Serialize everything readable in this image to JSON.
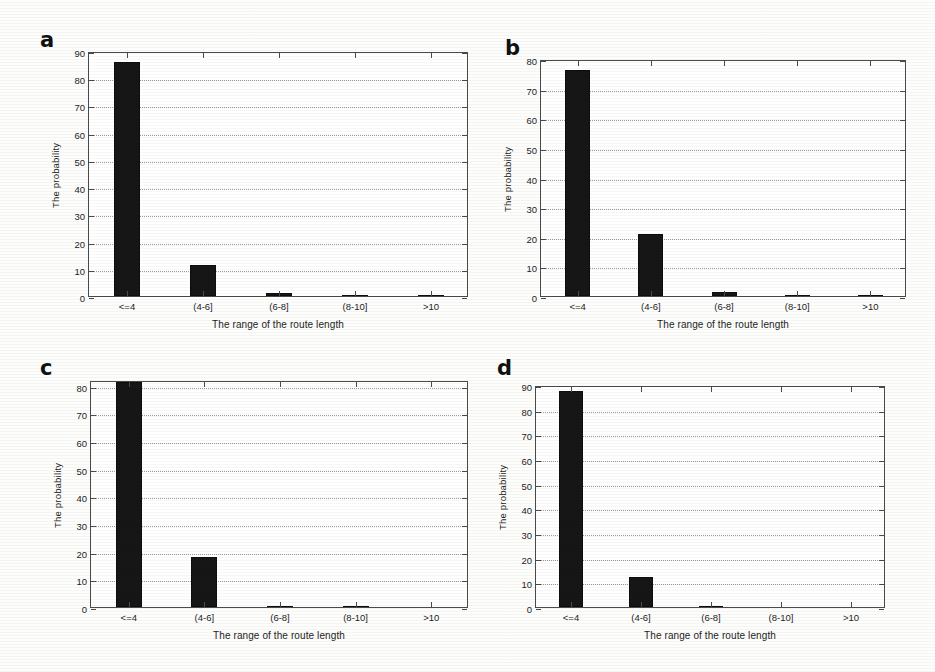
{
  "figure": {
    "background_color": "#fdfdfc",
    "bar_color": "#161616",
    "axis_color": "#4a4a4a",
    "grid_color": "#9a9a9a",
    "panel_letters": [
      "a",
      "b",
      "c",
      "d"
    ],
    "shared_xlabel": "The range of the route length",
    "shared_ylabel": "The probability",
    "shared_categories": [
      "<=4",
      "(4-6]",
      "(6-8]",
      "(8-10]",
      ">10"
    ]
  },
  "chart_data": [
    {
      "type": "bar",
      "panel": "a",
      "title": "",
      "xlabel": "The range of the route length",
      "ylabel": "The probability",
      "categories": [
        "<=4",
        "(4-6]",
        "(6-8]",
        "(8-10]",
        ">10"
      ],
      "values": [
        86,
        11.5,
        1.2,
        0.3,
        0.3
      ],
      "ylim": [
        0,
        90
      ],
      "yticks": [
        0,
        10,
        20,
        30,
        40,
        50,
        60,
        70,
        80,
        90
      ],
      "ytick_labels": [
        "0",
        "10",
        "20",
        "30",
        "40",
        "50",
        "60",
        "70",
        "80",
        "90"
      ],
      "grid": true,
      "legend": "none"
    },
    {
      "type": "bar",
      "panel": "b",
      "title": "",
      "xlabel": "The range of the route length",
      "ylabel": "The probability",
      "categories": [
        "<=4",
        "(4-6]",
        "(6-8]",
        "(8-10]",
        ">10"
      ],
      "values": [
        76.2,
        21,
        1.5,
        0.4,
        0.4
      ],
      "ylim": [
        0,
        80
      ],
      "yticks": [
        0,
        10,
        20,
        30,
        40,
        50,
        60,
        70,
        80
      ],
      "ytick_labels": [
        "0",
        "10",
        "20",
        "30",
        "40",
        "50",
        "60",
        "70",
        "80"
      ],
      "grid": true,
      "legend": "none"
    },
    {
      "type": "bar",
      "panel": "c",
      "title": "",
      "xlabel": "The range of the route length",
      "ylabel": "The probability",
      "categories": [
        "<=4",
        "(4-6]",
        "(6-8]",
        "(8-10]",
        ">10"
      ],
      "values": [
        81.2,
        18,
        0.4,
        0.4,
        0
      ],
      "ylim": [
        0,
        82
      ],
      "yticks": [
        0,
        10,
        20,
        30,
        40,
        50,
        60,
        70,
        80
      ],
      "ytick_labels": [
        "0",
        "10",
        "20",
        "30",
        "40",
        "50",
        "60",
        "70",
        "80"
      ],
      "grid": true,
      "legend": "none"
    },
    {
      "type": "bar",
      "panel": "d",
      "title": "",
      "xlabel": "The range of the route length",
      "ylabel": "The probability",
      "categories": [
        "<=4",
        "(4-6]",
        "(6-8]",
        "(8-10]",
        ">10"
      ],
      "values": [
        87.5,
        12,
        0.4,
        0,
        0
      ],
      "ylim": [
        0,
        90
      ],
      "yticks": [
        0,
        10,
        20,
        30,
        40,
        50,
        60,
        70,
        80,
        90
      ],
      "ytick_labels": [
        "0",
        "10",
        "20",
        "30",
        "40",
        "50",
        "60",
        "70",
        "80",
        "90"
      ],
      "grid": true,
      "legend": "none"
    }
  ],
  "layout": {
    "panels": [
      {
        "letter_x": 40,
        "letter_y": 30,
        "plot_x": 88,
        "plot_y": 52,
        "plot_w": 380,
        "plot_h": 245
      },
      {
        "letter_x": 505,
        "letter_y": 38,
        "plot_x": 540,
        "plot_y": 60,
        "plot_w": 366,
        "plot_h": 237
      },
      {
        "letter_x": 40,
        "letter_y": 358,
        "plot_x": 90,
        "plot_y": 381,
        "plot_w": 378,
        "plot_h": 227
      },
      {
        "letter_x": 497,
        "letter_y": 358,
        "plot_x": 535,
        "plot_y": 386,
        "plot_w": 350,
        "plot_h": 222
      }
    ]
  }
}
